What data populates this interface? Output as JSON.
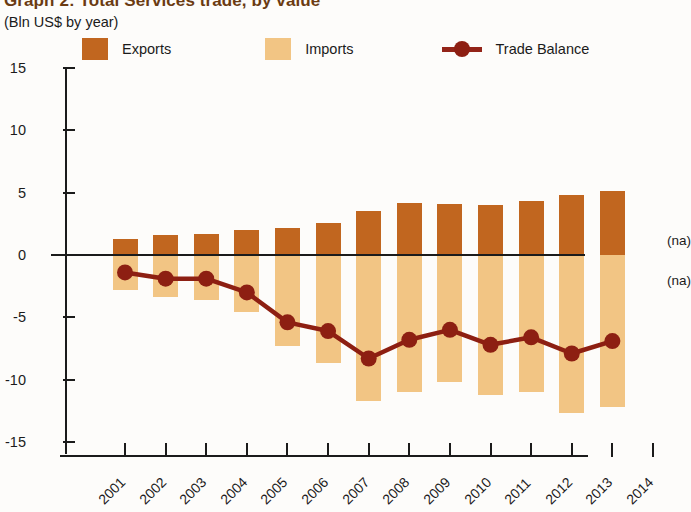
{
  "header": {
    "title": "Graph 2: Total Services trade, by value",
    "subtitle": "(Bln US$ by year)"
  },
  "legend": {
    "items": [
      {
        "label": "Exports",
        "color": "#c1661f",
        "marker": "swatch"
      },
      {
        "label": "Imports",
        "color": "#f2c584",
        "marker": "swatch"
      },
      {
        "label": "Trade Balance",
        "color": "#8d1f12",
        "marker": "line-dot"
      }
    ]
  },
  "annotations": {
    "na_above": "(na)",
    "na_below": "(na)"
  },
  "chart_data": {
    "type": "bar",
    "title": "Graph 2: Total Services trade, by value",
    "subtitle": "(Bln US$ by year)",
    "xlabel": "",
    "ylabel": "Bln US$",
    "ylim": [
      -15,
      15
    ],
    "yticks": [
      15,
      10,
      5,
      0,
      -5,
      -10,
      -15
    ],
    "ytick_labels": [
      "15",
      "10",
      "5",
      "0",
      "-5",
      "-10",
      "-15"
    ],
    "grid": false,
    "legend_position": "top",
    "categories": [
      "2001",
      "2002",
      "2003",
      "2004",
      "2005",
      "2006",
      "2007",
      "2008",
      "2009",
      "2010",
      "2011",
      "2012",
      "2013",
      "2014"
    ],
    "x_tick_labels": [
      "2001",
      "2002",
      "2003",
      "2004",
      "2005",
      "2006",
      "2007",
      "2008",
      "2009",
      "2010",
      "2011",
      "2012",
      "2013",
      "2014"
    ],
    "series": [
      {
        "name": "Exports",
        "type": "bar",
        "color": "#c1661f",
        "values": [
          1.3,
          1.6,
          1.7,
          2.0,
          2.2,
          2.6,
          3.5,
          4.2,
          4.1,
          4.0,
          4.3,
          4.8,
          5.1,
          null
        ]
      },
      {
        "name": "Imports",
        "type": "bar",
        "color": "#f2c584",
        "values": [
          -2.8,
          -3.4,
          -3.6,
          -4.6,
          -7.3,
          -8.7,
          -11.7,
          -11.0,
          -10.2,
          -11.2,
          -11.0,
          -12.7,
          -12.2,
          null
        ]
      },
      {
        "name": "Trade Balance",
        "type": "line",
        "color": "#8d1f12",
        "values": [
          -1.4,
          -1.9,
          -1.9,
          -3.0,
          -5.4,
          -6.1,
          -8.3,
          -6.8,
          -6.0,
          -7.2,
          -6.6,
          -7.9,
          -6.9,
          null
        ]
      }
    ]
  }
}
